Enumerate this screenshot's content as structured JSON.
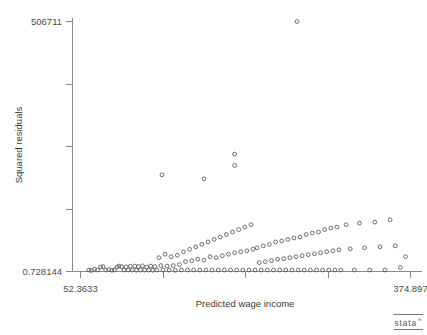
{
  "chart_data": {
    "type": "scatter",
    "title": "",
    "xlabel": "Predicted wage income",
    "ylabel": "Squared residuals",
    "xlim": [
      52.3633,
      374.897
    ],
    "ylim": [
      0.728144,
      506711
    ],
    "xticks": [
      52.3633,
      132.997,
      213.63,
      294.264,
      374.897
    ],
    "yticks": [
      0.728144,
      126678.5,
      253356.2,
      380033.9,
      506711
    ],
    "xtick_labels_shown": [
      "52.3633",
      "374.897"
    ],
    "ytick_labels_shown": [
      "0.728144",
      "506711"
    ],
    "grid": false,
    "legend": "none",
    "marker": "open-circle",
    "marker_color": "#5c5c5c",
    "background": "#ffffff",
    "points": [
      [
        60.5,
        3000
      ],
      [
        63.0,
        2000
      ],
      [
        66.0,
        4500
      ],
      [
        69.0,
        3000
      ],
      [
        72.0,
        9000
      ],
      [
        74.5,
        10000
      ],
      [
        77.0,
        3000
      ],
      [
        80.0,
        4000
      ],
      [
        83.0,
        2500
      ],
      [
        85.5,
        3000
      ],
      [
        88.0,
        9000
      ],
      [
        90.0,
        11000
      ],
      [
        92.5,
        10000
      ],
      [
        95.0,
        3000
      ],
      [
        97.0,
        9500
      ],
      [
        99.0,
        3000
      ],
      [
        101.0,
        10500
      ],
      [
        103.0,
        3000
      ],
      [
        105.5,
        11000
      ],
      [
        107.0,
        2500
      ],
      [
        109.0,
        10000
      ],
      [
        111.0,
        3000
      ],
      [
        113.0,
        11500
      ],
      [
        115.0,
        2800
      ],
      [
        117.0,
        9000
      ],
      [
        119.0,
        3000
      ],
      [
        121.0,
        11000
      ],
      [
        123.0,
        2500
      ],
      [
        125.0,
        10000
      ],
      [
        127.0,
        3000
      ],
      [
        129.0,
        28000
      ],
      [
        131.0,
        12000
      ],
      [
        133.0,
        3000
      ],
      [
        135.0,
        35000
      ],
      [
        137.0,
        11000
      ],
      [
        139.0,
        3000
      ],
      [
        141.0,
        30000
      ],
      [
        143.0,
        12000
      ],
      [
        145.0,
        2500
      ],
      [
        147.0,
        33000
      ],
      [
        149.0,
        14000
      ],
      [
        151.0,
        3000
      ],
      [
        153.0,
        40000
      ],
      [
        155.0,
        20000
      ],
      [
        157.0,
        3000
      ],
      [
        159.0,
        45000
      ],
      [
        161.0,
        22000
      ],
      [
        163.0,
        3000
      ],
      [
        165.0,
        50000
      ],
      [
        167.0,
        25000
      ],
      [
        169.0,
        3000
      ],
      [
        171.0,
        55000
      ],
      [
        173.0,
        23000
      ],
      [
        175.0,
        3000
      ],
      [
        177.0,
        60000
      ],
      [
        179.0,
        30000
      ],
      [
        181.0,
        3000
      ],
      [
        183.0,
        65000
      ],
      [
        185.0,
        28000
      ],
      [
        187.0,
        3000
      ],
      [
        189.0,
        70000
      ],
      [
        191.0,
        32000
      ],
      [
        193.0,
        3000
      ],
      [
        195.0,
        75000
      ],
      [
        197.0,
        35000
      ],
      [
        199.0,
        3000
      ],
      [
        201.0,
        80000
      ],
      [
        203.0,
        38000
      ],
      [
        205.0,
        3000
      ],
      [
        207.0,
        85000
      ],
      [
        209.0,
        40000
      ],
      [
        211.0,
        3000
      ],
      [
        213.0,
        90000
      ],
      [
        215.0,
        42000
      ],
      [
        217.0,
        3000
      ],
      [
        219.0,
        95000
      ],
      [
        221.0,
        45000
      ],
      [
        223.0,
        3000
      ],
      [
        225.0,
        48000
      ],
      [
        227.0,
        18000
      ],
      [
        229.0,
        3000
      ],
      [
        231.0,
        52000
      ],
      [
        233.0,
        20000
      ],
      [
        235.0,
        3000
      ],
      [
        237.0,
        55000
      ],
      [
        239.0,
        22000
      ],
      [
        241.0,
        3000
      ],
      [
        243.0,
        60000
      ],
      [
        245.0,
        25000
      ],
      [
        247.0,
        3000
      ],
      [
        249.0,
        62000
      ],
      [
        251.0,
        26000
      ],
      [
        253.0,
        3000
      ],
      [
        255.0,
        65000
      ],
      [
        257.0,
        28000
      ],
      [
        259.0,
        3000
      ],
      [
        261.0,
        68000
      ],
      [
        263.0,
        30000
      ],
      [
        265.0,
        3000
      ],
      [
        267.0,
        70000
      ],
      [
        269.0,
        32000
      ],
      [
        271.0,
        3000
      ],
      [
        273.0,
        75000
      ],
      [
        275.0,
        34000
      ],
      [
        277.0,
        3000
      ],
      [
        279.0,
        78000
      ],
      [
        281.0,
        36000
      ],
      [
        283.0,
        3000
      ],
      [
        285.0,
        80000
      ],
      [
        287.0,
        38000
      ],
      [
        289.0,
        3000
      ],
      [
        291.0,
        85000
      ],
      [
        293.0,
        40000
      ],
      [
        295.0,
        3000
      ],
      [
        297.0,
        88000
      ],
      [
        299.0,
        42000
      ],
      [
        301.0,
        3000
      ],
      [
        303.0,
        90000
      ],
      [
        305.0,
        44000
      ],
      [
        307.0,
        3000
      ],
      [
        312.0,
        95000
      ],
      [
        316.0,
        46000
      ],
      [
        320.0,
        3000
      ],
      [
        325.0,
        98000
      ],
      [
        330.0,
        48000
      ],
      [
        335.0,
        3000
      ],
      [
        340.0,
        100000
      ],
      [
        345.0,
        50000
      ],
      [
        350.0,
        3000
      ],
      [
        355.0,
        105000
      ],
      [
        360.0,
        52000
      ],
      [
        365.0,
        8000
      ],
      [
        370.0,
        30000
      ],
      [
        132.0,
        196000
      ],
      [
        173.0,
        188000
      ],
      [
        203.0,
        238000
      ],
      [
        203.0,
        215000
      ],
      [
        264.0,
        506711
      ]
    ],
    "n_points_approx": 260
  },
  "branding": {
    "logo_text": "stata",
    "logo_tm": "™"
  },
  "axes": {
    "x": {
      "title": "Predicted wage income",
      "min_label": "52.3633",
      "max_label": "374.897"
    },
    "y": {
      "title": "Squared residuals",
      "min_label": "0.728144",
      "max_label": "506711"
    }
  }
}
